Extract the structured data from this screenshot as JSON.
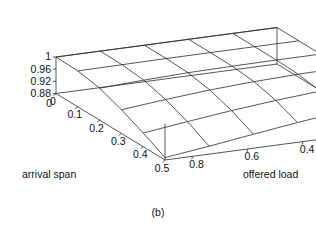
{
  "figure": {
    "caption": "(b)",
    "type": "3d-surface-mesh"
  },
  "axes": {
    "x": {
      "title": "arrival span",
      "ticks": [
        "0",
        "0.1",
        "0.2",
        "0.3",
        "0.4",
        "0.5"
      ],
      "values": [
        0,
        0.1,
        0.2,
        0.3,
        0.4,
        0.5
      ],
      "range": [
        0,
        0.5
      ]
    },
    "y": {
      "title": "offered load",
      "ticks": [
        "0.8",
        "0.6",
        "0.4",
        "0.2"
      ],
      "values": [
        0.8,
        0.6,
        0.4,
        0.2
      ],
      "range": [
        0.9,
        0.1
      ]
    },
    "z": {
      "title": "",
      "ticks": [
        "0.88",
        "0.92",
        "0.96",
        "1"
      ],
      "values": [
        0.88,
        0.92,
        0.96,
        1.0
      ],
      "range": [
        0.88,
        1.0
      ],
      "origin_label": "0"
    }
  },
  "chart_data": {
    "type": "surface",
    "title": "",
    "subtitle": "",
    "xlabel": "arrival span",
    "ylabel": "offered load",
    "zlabel": "",
    "xlim": [
      0,
      0.5
    ],
    "ylim": [
      0.9,
      0.1
    ],
    "zlim": [
      0.88,
      1.0
    ],
    "grid": false,
    "legend": "none",
    "annotations": [
      "(b)"
    ],
    "x": [
      0,
      0.1,
      0.2,
      0.3,
      0.4,
      0.5
    ],
    "y": [
      0.1,
      0.25,
      0.4,
      0.55,
      0.7,
      0.9
    ],
    "z_rows_note": "rows indexed by y (offered load, back-to-front), columns by x (arrival span, left-to-right)",
    "z": [
      [
        1.0,
        1.0,
        1.0,
        1.0,
        1.0,
        1.0
      ],
      [
        0.998,
        0.999,
        1.0,
        1.0,
        1.0,
        1.0
      ],
      [
        0.985,
        0.992,
        0.997,
        0.999,
        1.0,
        1.0
      ],
      [
        0.958,
        0.972,
        0.984,
        0.992,
        0.997,
        0.999
      ],
      [
        0.925,
        0.943,
        0.96,
        0.974,
        0.985,
        0.993
      ],
      [
        0.888,
        0.906,
        0.926,
        0.945,
        0.962,
        0.978
      ]
    ],
    "series": [
      {
        "name": "offered load 0.1",
        "values": [
          1.0,
          1.0,
          1.0,
          1.0,
          1.0,
          1.0
        ]
      },
      {
        "name": "offered load 0.25",
        "values": [
          0.998,
          0.999,
          1.0,
          1.0,
          1.0,
          1.0
        ]
      },
      {
        "name": "offered load 0.4",
        "values": [
          0.985,
          0.992,
          0.997,
          0.999,
          1.0,
          1.0
        ]
      },
      {
        "name": "offered load 0.55",
        "values": [
          0.958,
          0.972,
          0.984,
          0.992,
          0.997,
          0.999
        ]
      },
      {
        "name": "offered load 0.7",
        "values": [
          0.925,
          0.943,
          0.96,
          0.974,
          0.985,
          0.993
        ]
      },
      {
        "name": "offered load 0.9",
        "values": [
          0.888,
          0.906,
          0.926,
          0.945,
          0.962,
          0.978
        ]
      }
    ]
  },
  "style": {
    "line_color": "#2b2b2b",
    "text_color": "#111111",
    "background": "#ffffff"
  }
}
